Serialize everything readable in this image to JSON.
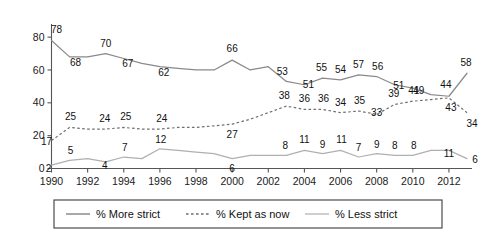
{
  "chart_data": {
    "type": "line",
    "title": "",
    "subtitle": "",
    "xlabel": "",
    "ylabel": "",
    "grid": false,
    "legend_position": "bottom",
    "xlim": [
      1990,
      2013
    ],
    "ylim": [
      0,
      88
    ],
    "yticks": [
      0,
      20,
      40,
      60,
      80
    ],
    "ytick_labels": [
      "0",
      "20",
      "40",
      "60",
      "80"
    ],
    "xticks": [
      1990,
      1992,
      1994,
      1996,
      1998,
      2000,
      2002,
      2004,
      2006,
      2008,
      2010,
      2012
    ],
    "xtick_labels": [
      "1990",
      "1992",
      "1994",
      "1996",
      "1998",
      "2000",
      "2002",
      "2004",
      "2006",
      "2008",
      "2010",
      "2012"
    ],
    "x": [
      1990,
      1991,
      1992,
      1993,
      1994,
      1995,
      1996,
      1997,
      1998,
      1999,
      2000,
      2001,
      2002,
      2003,
      2004,
      2005,
      2006,
      2007,
      2008,
      2009,
      2010,
      2011,
      2012,
      2013
    ],
    "series": [
      {
        "name": "% More strict",
        "style": "solid",
        "color": "#8a8a8a",
        "values": [
          78,
          68,
          68,
          70,
          67,
          64,
          62,
          61,
          60,
          60,
          66,
          60,
          62,
          53,
          51,
          55,
          54,
          57,
          56,
          51,
          49,
          45,
          44,
          58
        ],
        "labels": [
          {
            "x": 1990,
            "value": 78,
            "text": "78"
          },
          {
            "x": 1991,
            "value": 68,
            "text": "68"
          },
          {
            "x": 1993,
            "value": 70,
            "text": "70"
          },
          {
            "x": 1994,
            "value": 67,
            "text": "67"
          },
          {
            "x": 1996,
            "value": 62,
            "text": "62"
          },
          {
            "x": 2000,
            "value": 66,
            "text": "66"
          },
          {
            "x": 2003,
            "value": 53,
            "text": "53"
          },
          {
            "x": 2004,
            "value": 51,
            "text": "51"
          },
          {
            "x": 2005,
            "value": 55,
            "text": "55"
          },
          {
            "x": 2006,
            "value": 54,
            "text": "54"
          },
          {
            "x": 2007,
            "value": 57,
            "text": "57"
          },
          {
            "x": 2008,
            "value": 56,
            "text": "56"
          },
          {
            "x": 2009,
            "value": 51,
            "text": "51"
          },
          {
            "x": 2010,
            "value": 49,
            "text": "49"
          },
          {
            "x": 2012,
            "value": 44,
            "text": "44"
          },
          {
            "x": 2013,
            "value": 58,
            "text": "58"
          }
        ]
      },
      {
        "name": "% Kept as now",
        "style": "dotted",
        "color": "#6f6f6f",
        "values": [
          17,
          25,
          24,
          24,
          25,
          24,
          24,
          25,
          25,
          26,
          27,
          30,
          34,
          38,
          36,
          36,
          34,
          35,
          33,
          39,
          41,
          42,
          43,
          34
        ],
        "labels": [
          {
            "x": 1990,
            "value": 17,
            "text": "17"
          },
          {
            "x": 1991,
            "value": 25,
            "text": "25"
          },
          {
            "x": 1993,
            "value": 24,
            "text": "24"
          },
          {
            "x": 1994,
            "value": 25,
            "text": "25"
          },
          {
            "x": 1996,
            "value": 24,
            "text": "24"
          },
          {
            "x": 2000,
            "value": 27,
            "text": "27"
          },
          {
            "x": 2003,
            "value": 38,
            "text": "38"
          },
          {
            "x": 2004,
            "value": 36,
            "text": "36"
          },
          {
            "x": 2005,
            "value": 36,
            "text": "36"
          },
          {
            "x": 2006,
            "value": 34,
            "text": "34"
          },
          {
            "x": 2007,
            "value": 35,
            "text": "35"
          },
          {
            "x": 2008,
            "value": 33,
            "text": "33"
          },
          {
            "x": 2009,
            "value": 39,
            "text": "39"
          },
          {
            "x": 2010,
            "value": 41,
            "text": "41"
          },
          {
            "x": 2012,
            "value": 43,
            "text": "43"
          },
          {
            "x": 2013,
            "value": 34,
            "text": "34"
          }
        ]
      },
      {
        "name": "% Less strict",
        "style": "solid",
        "color": "#b0b0b0",
        "values": [
          2,
          5,
          6,
          4,
          7,
          6,
          12,
          11,
          10,
          9,
          6,
          8,
          8,
          8,
          11,
          9,
          11,
          7,
          9,
          8,
          8,
          11,
          11,
          6
        ],
        "labels": [
          {
            "x": 1990,
            "value": 2,
            "text": "2"
          },
          {
            "x": 1991,
            "value": 5,
            "text": "5"
          },
          {
            "x": 1993,
            "value": 4,
            "text": "4"
          },
          {
            "x": 1994,
            "value": 7,
            "text": "7"
          },
          {
            "x": 1996,
            "value": 12,
            "text": "12"
          },
          {
            "x": 2000,
            "value": 6,
            "text": "6"
          },
          {
            "x": 2003,
            "value": 8,
            "text": "8"
          },
          {
            "x": 2004,
            "value": 11,
            "text": "11"
          },
          {
            "x": 2005,
            "value": 9,
            "text": "9"
          },
          {
            "x": 2006,
            "value": 11,
            "text": "11"
          },
          {
            "x": 2007,
            "value": 7,
            "text": "7"
          },
          {
            "x": 2008,
            "value": 9,
            "text": "9"
          },
          {
            "x": 2009,
            "value": 8,
            "text": "8"
          },
          {
            "x": 2010,
            "value": 8,
            "text": "8"
          },
          {
            "x": 2012,
            "value": 11,
            "text": "11"
          },
          {
            "x": 2013,
            "value": 6,
            "text": "6"
          }
        ]
      }
    ]
  },
  "legend": {
    "items": [
      {
        "label": "% More strict",
        "style": "solid-dark"
      },
      {
        "label": "% Kept as now",
        "style": "dotted"
      },
      {
        "label": "% Less strict",
        "style": "solid-light"
      }
    ]
  }
}
